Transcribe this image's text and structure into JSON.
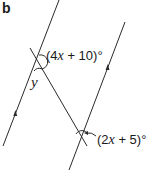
{
  "part_label": "b",
  "angles": {
    "top": {
      "prefix": "(4",
      "var": "x",
      "suffix": " + 10)°"
    },
    "bottom": {
      "prefix": "(2",
      "var": "x",
      "suffix": " + 5)°"
    }
  },
  "unknown": "y",
  "colors": {
    "line": "#2a2a2a",
    "text": "#1a1a1a"
  }
}
